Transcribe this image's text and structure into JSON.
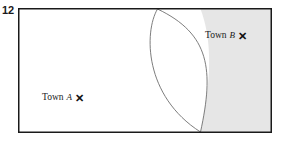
{
  "question": {
    "number": "12"
  },
  "diagram": {
    "name": "locus-diagram-two-towns",
    "frame": {
      "x": 18,
      "y": 8,
      "width": 254,
      "height": 125,
      "border_color": "#1a1a1a",
      "fill_color": "#ffffff"
    },
    "shaded_region": {
      "label": "shaded-region-nearer-town-b",
      "fill_color": "#e6e6e6",
      "stroke_color": "#9a9a9a"
    },
    "arcs": [
      {
        "name": "arc-left",
        "stroke_color": "#6e6e6e"
      },
      {
        "name": "arc-right",
        "stroke_color": "#6e6e6e"
      }
    ],
    "labels": {
      "town_a": {
        "name": "Town",
        "id": "A",
        "marker": "✕"
      },
      "town_b": {
        "name": "Town",
        "id": "B",
        "marker": "✕"
      }
    }
  }
}
